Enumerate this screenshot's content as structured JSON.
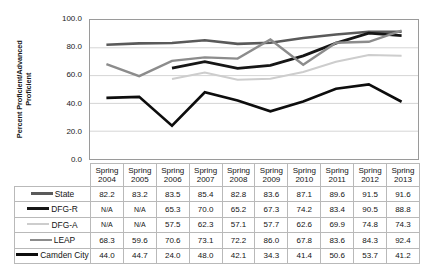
{
  "chart_data": {
    "type": "line",
    "title": "",
    "xlabel": "",
    "ylabel": "Percent Proficient/Advanced Proficient",
    "ylim": [
      0.0,
      100.0
    ],
    "ytick_labels": [
      "100.0",
      "80.0",
      "60.0",
      "40.0",
      "20.0",
      "0.0"
    ],
    "ytick_values": [
      100.0,
      80.0,
      60.0,
      40.0,
      20.0,
      0.0
    ],
    "grid": true,
    "legend_position": "table-left",
    "categories": [
      "Spring 2004",
      "Spring 2005",
      "Spring 2006",
      "Spring 2007",
      "Spring 2008",
      "Spring 2009",
      "Spring 2010",
      "Spring 2011",
      "Spring 2012",
      "Spring 2013"
    ],
    "category_lines": [
      [
        "Spring",
        "2004"
      ],
      [
        "Spring",
        "2005"
      ],
      [
        "Spring",
        "2006"
      ],
      [
        "Spring",
        "2007"
      ],
      [
        "Spring",
        "2008"
      ],
      [
        "Spring",
        "2009"
      ],
      [
        "Spring",
        "2010"
      ],
      [
        "Spring",
        "2011"
      ],
      [
        "Spring",
        "2012"
      ],
      [
        "Spring",
        "2013"
      ]
    ],
    "na_label": "N/A",
    "series": [
      {
        "name": "State",
        "color": "#5a5a5a",
        "width": 2.6,
        "values": [
          82.2,
          83.2,
          83.5,
          85.4,
          82.8,
          83.6,
          87.1,
          89.6,
          91.5,
          91.6
        ],
        "display": [
          "82.2",
          "83.2",
          "83.5",
          "85.4",
          "82.8",
          "83.6",
          "87.1",
          "89.6",
          "91.5",
          "91.6"
        ]
      },
      {
        "name": "DFG-R",
        "color": "#161616",
        "width": 2.8,
        "values": [
          null,
          null,
          65.3,
          70.0,
          65.2,
          67.3,
          74.2,
          83.4,
          90.5,
          88.8
        ],
        "display": [
          "N/A",
          "N/A",
          "65.3",
          "70.0",
          "65.2",
          "67.3",
          "74.2",
          "83.4",
          "90.5",
          "88.8"
        ]
      },
      {
        "name": "DFG-A",
        "color": "#cdcdcd",
        "width": 2.0,
        "values": [
          null,
          null,
          57.5,
          62.3,
          57.1,
          57.7,
          62.6,
          69.9,
          74.8,
          74.3
        ],
        "display": [
          "N/A",
          "N/A",
          "57.5",
          "62.3",
          "57.1",
          "57.7",
          "62.6",
          "69.9",
          "74.8",
          "74.3"
        ]
      },
      {
        "name": "LEAP",
        "color": "#8c8c8c",
        "width": 2.4,
        "values": [
          68.3,
          59.6,
          70.6,
          73.1,
          72.2,
          86.0,
          67.8,
          83.6,
          84.3,
          92.4
        ],
        "display": [
          "68.3",
          "59.6",
          "70.6",
          "73.1",
          "72.2",
          "86.0",
          "67.8",
          "83.6",
          "84.3",
          "92.4"
        ]
      },
      {
        "name": "Camden City",
        "color": "#0d0d0d",
        "width": 2.6,
        "values": [
          44.0,
          44.7,
          24.0,
          48.0,
          42.1,
          34.3,
          41.4,
          50.6,
          53.7,
          41.2
        ],
        "display": [
          "44.0",
          "44.7",
          "24.0",
          "48.0",
          "42.1",
          "34.3",
          "41.4",
          "50.6",
          "53.7",
          "41.2"
        ]
      }
    ]
  },
  "colors": {
    "plot_border": "#9a9a9a",
    "gridline": "#d4d4d4",
    "table_border": "#b9b9b9",
    "text": "#141414",
    "na_text": "#6d6d6d",
    "background": "#ffffff"
  }
}
